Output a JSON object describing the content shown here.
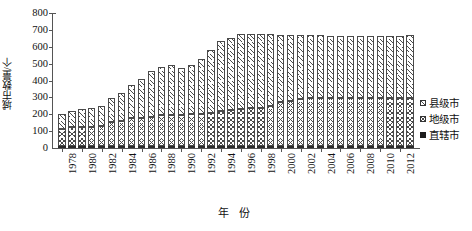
{
  "chart_data": {
    "type": "bar",
    "stacked": true,
    "title": "",
    "xlabel": "年 份",
    "ylabel": "城市数量/个",
    "ylim": [
      0,
      800
    ],
    "ytick_step": 100,
    "yticks": [
      800,
      700,
      600,
      500,
      400,
      300,
      200,
      100,
      0
    ],
    "grid": false,
    "legend_position": "right",
    "x": [
      1978,
      1979,
      1980,
      1981,
      1982,
      1983,
      1984,
      1985,
      1986,
      1987,
      1988,
      1989,
      1990,
      1991,
      1992,
      1993,
      1994,
      1995,
      1996,
      1997,
      1998,
      1999,
      2000,
      2001,
      2002,
      2003,
      2004,
      2005,
      2006,
      2007,
      2008,
      2009,
      2010,
      2011,
      2012,
      2013
    ],
    "xtick_labels": [
      "1978",
      "1980",
      "1982",
      "1984",
      "1986",
      "1988",
      "1990",
      "1992",
      "1994",
      "1996",
      "1998",
      "2000",
      "2002",
      "2004",
      "2006",
      "2008",
      "2010",
      "2012"
    ],
    "series": [
      {
        "name": "县级市",
        "pattern": "diagonal-hatch",
        "color": "#ffffff",
        "values": [
          91,
          98,
          107,
          113,
          121,
          140,
          165,
          198,
          232,
          272,
          284,
          295,
          279,
          289,
          323,
          371,
          413,
          427,
          445,
          442,
          437,
          427,
          400,
          393,
          381,
          374,
          374,
          369,
          369,
          368,
          368,
          367,
          370,
          369,
          368,
          368
        ]
      },
      {
        "name": "地级市",
        "pattern": "cross-hatch",
        "color": "#ffffff",
        "values": [
          98,
          109,
          114,
          114,
          116,
          141,
          148,
          162,
          166,
          170,
          183,
          185,
          185,
          187,
          191,
          196,
          206,
          210,
          218,
          222,
          227,
          236,
          259,
          265,
          275,
          282,
          283,
          283,
          283,
          283,
          283,
          283,
          283,
          284,
          285,
          286
        ]
      },
      {
        "name": "直辖市",
        "pattern": "solid",
        "color": "#2b2b2b",
        "values": [
          3,
          3,
          3,
          3,
          3,
          3,
          3,
          3,
          3,
          3,
          3,
          3,
          3,
          3,
          3,
          3,
          3,
          3,
          4,
          4,
          4,
          4,
          4,
          4,
          4,
          4,
          4,
          4,
          4,
          4,
          4,
          4,
          4,
          4,
          4,
          4
        ]
      }
    ],
    "totals": [
      192,
      210,
      224,
      230,
      240,
      284,
      316,
      363,
      401,
      445,
      470,
      483,
      467,
      479,
      517,
      570,
      622,
      640,
      667,
      668,
      668,
      667,
      663,
      662,
      660,
      660,
      661,
      656,
      656,
      655,
      655,
      654,
      657,
      657,
      657,
      658
    ]
  },
  "legend": {
    "items": [
      {
        "label": "县级市",
        "swatch": "county-swatch"
      },
      {
        "label": "地级市",
        "swatch": "prefecture-swatch"
      },
      {
        "label": "直辖市",
        "swatch": "municipality-swatch"
      }
    ]
  }
}
